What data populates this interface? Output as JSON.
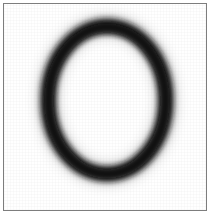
{
  "image": {
    "kind": "character-bitmap-sample",
    "width": 210,
    "height": 214,
    "background_color": "#ffffff",
    "alt_text": "Blurred low-resolution bitmap of the character O inside a thin gray frame"
  },
  "frame": {
    "name": "sample-frame",
    "border_color": "#7d7d7d",
    "border_width": 1,
    "inset": 3,
    "fill_color": "#ffffff"
  },
  "glyph": {
    "character": "O",
    "description": "ring",
    "ink_color": "#141414",
    "halo_color": "#6b6b6b",
    "center_x": 107,
    "center_y": 100,
    "outer_radius_x": 66,
    "outer_radius_y": 81,
    "stroke_width": 14,
    "blur_radius": 3.4,
    "bounds": {
      "left": 42,
      "top": 20,
      "right": 175,
      "bottom": 182
    },
    "hole_color": "#ffffff"
  }
}
